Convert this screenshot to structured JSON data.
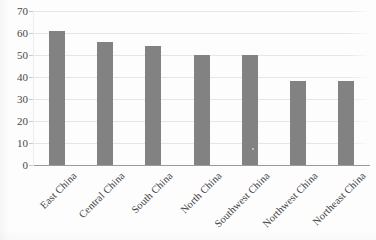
{
  "chart_data": {
    "type": "bar",
    "title": "",
    "subtitle": "",
    "xlabel": "",
    "ylabel": "",
    "categories": [
      "East China",
      "Central China",
      "South China",
      "North China",
      "Southwest China",
      "Northwest China",
      "Northeast China"
    ],
    "values": [
      61,
      56,
      54,
      50,
      50,
      38,
      38
    ],
    "ylim": [
      0,
      70
    ],
    "ytick_labels": [
      "0",
      "10",
      "20",
      "30",
      "40",
      "50",
      "60",
      "70"
    ],
    "ytick_values": [
      0,
      10,
      20,
      30,
      40,
      50,
      60,
      70
    ],
    "grid": "horizontal",
    "legend": "none",
    "bar_color": "#828282",
    "gridline_color": "#e6e6e6",
    "axis_color": "#9a9a9a",
    "background_color": "#fdfdfd",
    "xtick_rotation_degrees": 45
  }
}
